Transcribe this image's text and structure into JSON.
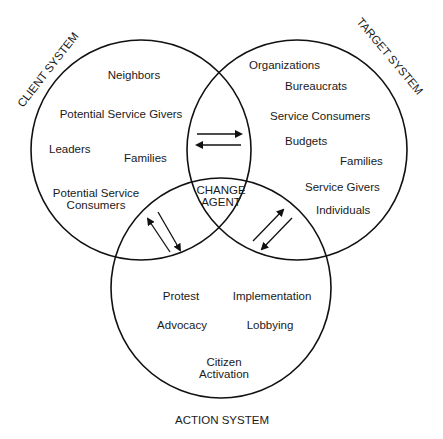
{
  "diagram": {
    "systems": {
      "client": {
        "title": "CLIENT SYSTEM",
        "items": [
          "Neighbors",
          "Potential Service Givers",
          "Leaders",
          "Families",
          "Potential Service",
          "Consumers"
        ]
      },
      "target": {
        "title": "TARGET SYSTEM",
        "items": [
          "Organizations",
          "Bureaucrats",
          "Service Consumers",
          "Budgets",
          "Families",
          "Service Givers",
          "Individuals"
        ]
      },
      "action": {
        "title": "ACTION SYSTEM",
        "items": [
          "Protest",
          "Implementation",
          "Advocacy",
          "Lobbying",
          "Citizen",
          "Activation"
        ]
      },
      "center": {
        "line1": "CHANGE",
        "line2": "AGENT"
      }
    },
    "colors": {
      "stroke": "#111111",
      "text": "#1a1a1a",
      "background": "#ffffff"
    }
  }
}
